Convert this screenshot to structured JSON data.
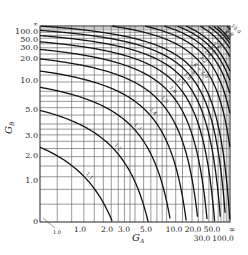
{
  "chart_data": {
    "type": "line",
    "title": "",
    "xlabel": "G_A",
    "ylabel": "G_B",
    "x_ticks": [
      "0",
      "1.0",
      "1.0",
      "2.0",
      "3.0",
      "5.0",
      "10.0",
      "20.0",
      "30.0",
      "50.0",
      "100.0",
      "∞"
    ],
    "y_ticks": [
      "0",
      "1.0",
      "2.0",
      "3.0",
      "5.0",
      "10.0",
      "20.0",
      "30.0",
      "50.0",
      "100.0",
      "∞"
    ],
    "scale": "nonlinear G/(1+G) style axis, 0 to ∞",
    "grid": true,
    "series": [
      {
        "name": "K = 1.0"
      },
      {
        "name": "K = 1.1"
      },
      {
        "name": "K = 1.2"
      },
      {
        "name": "K = 1.3"
      },
      {
        "name": "K = 1.4"
      },
      {
        "name": "K = 1.5"
      },
      {
        "name": "K = 1.6"
      },
      {
        "name": "K = 1.7"
      },
      {
        "name": "K = 1.8"
      },
      {
        "name": "K = 1.9"
      },
      {
        "name": "K = 2.0"
      },
      {
        "name": "K = 2.2"
      },
      {
        "name": "K = 2.4"
      },
      {
        "name": "K = 2.6"
      },
      {
        "name": "K = 2.8"
      },
      {
        "name": "K = 3.0"
      },
      {
        "name": "K = 3.5"
      },
      {
        "name": "K = 4.0"
      },
      {
        "name": "K = 4.5"
      },
      {
        "name": "K = 5.0"
      },
      {
        "name": "K = 10.0"
      },
      {
        "name": "K = 100"
      }
    ],
    "curve_labels": [
      "1.0",
      "1.1",
      "1.2",
      "1.3",
      "1.4",
      "1.5",
      "1.6",
      "1.7",
      "1.8",
      "1.9",
      "K = 2.0",
      "2.2",
      "2.4",
      "2.6",
      "2.8",
      "3.0",
      "3.5",
      "4.0",
      "4.5",
      "5.0",
      "10.0",
      "100"
    ],
    "legend": "none (labels inline on curves)"
  },
  "axes": {
    "x_label": "G",
    "x_sub": "A",
    "y_label": "G",
    "y_sub": "B",
    "x_tick_labels_row1": [
      {
        "t": "1.0",
        "x": 80
      },
      {
        "t": "2.0",
        "x": 107
      },
      {
        "t": "3.0",
        "x": 124
      },
      {
        "t": "5.0",
        "x": 146
      },
      {
        "t": "10.0",
        "x": 174
      },
      {
        "t": "20.0",
        "x": 193
      },
      {
        "t": "50.0",
        "x": 212
      },
      {
        "t": "∞",
        "x": 232
      }
    ],
    "x_tick_labels_row2": [
      {
        "t": "30.0",
        "x": 202
      },
      {
        "t": "100.0",
        "x": 223
      }
    ],
    "x_small": {
      "t": "1.0",
      "x": 57
    },
    "y_tick_labels": [
      {
        "t": "100.0",
        "y": 34
      },
      {
        "t": "50.0",
        "y": 42
      },
      {
        "t": "30.0",
        "y": 50
      },
      {
        "t": "20.0",
        "y": 61
      },
      {
        "t": "10.0",
        "y": 83
      },
      {
        "t": "5.0",
        "y": 112
      },
      {
        "t": "3.0",
        "y": 138
      },
      {
        "t": "2.0",
        "y": 158
      },
      {
        "t": "1.0",
        "y": 183
      },
      {
        "t": "0",
        "y": 224
      }
    ],
    "y_inf": "∞",
    "origin_zero": "0"
  }
}
